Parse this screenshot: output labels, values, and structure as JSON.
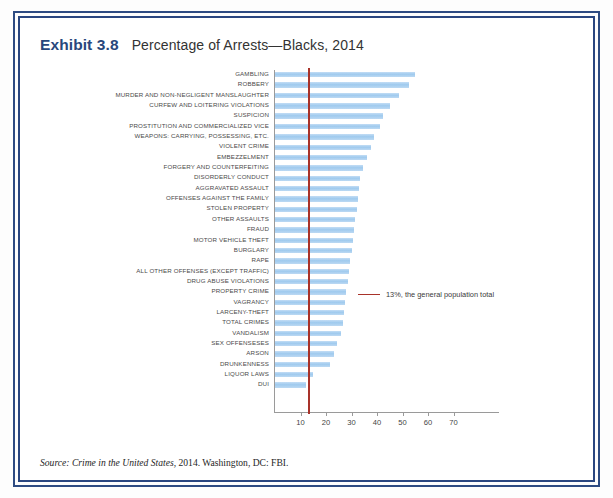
{
  "exhibit": {
    "number": "Exhibit 3.8",
    "title": "Percentage of Arrests—Blacks, 2014"
  },
  "source": {
    "prefix": "Source:",
    "work": "Crime in the United States",
    "rest": ", 2014. Washington, DC: FBI."
  },
  "legend": {
    "label": "13%, the general population total",
    "color": "#a8332a"
  },
  "colors": {
    "frame": "#2e4b82",
    "bar": "#a9d0f0",
    "reference": "#a8332a",
    "axis": "#9a9a9a",
    "heading": "#28477c"
  },
  "chart_data": {
    "type": "bar",
    "orientation": "horizontal",
    "title": "Percentage of Arrests—Blacks, 2014",
    "xlabel": "",
    "ylabel": "",
    "xlim": [
      0,
      72
    ],
    "xticks": [
      10,
      20,
      30,
      40,
      50,
      60,
      70
    ],
    "grid": false,
    "legend_position": "middle-right",
    "reference_line": {
      "value": 13,
      "label": "13%, the general population total",
      "color": "#a8332a"
    },
    "categories": [
      "GAMBLING",
      "ROBBERY",
      "MURDER AND NON-NEGLIGENT MANSLAUGHTER",
      "CURFEW AND LOITERING VIOLATIONS",
      "SUSPICION",
      "PROSTITUTION AND COMMERCIALIZED VICE",
      "WEAPONS: CARRYING, POSSESSING, ETC.",
      "VIOLENT CRIME",
      "EMBEZZELMENT",
      "FORGERY AND COUNTERFEITING",
      "DISORDERLY CONDUCT",
      "AGGRAVATED ASSAULT",
      "OFFENSES AGAINST THE FAMILY",
      "STOLEN PROPERTY",
      "OTHER ASSAULTS",
      "FRAUD",
      "MOTOR VEHICLE THEFT",
      "BURGLARY",
      "RAPE",
      "ALL OTHER OFFENSES (EXCEPT TRAFFIC)",
      "DRUG ABUSE VIOLATIONS",
      "PROPERTY CRIME",
      "VAGRANCY",
      "LARCENY-THEFT",
      "TOTAL CRIMES",
      "VANDALISM",
      "SEX OFFENSESES",
      "ARSON",
      "DRUNKENNESS",
      "LIQUOR LAWS",
      "DUI"
    ],
    "values": [
      55.0,
      52.5,
      48.5,
      45.0,
      42.5,
      41.0,
      39.0,
      37.5,
      36.0,
      34.5,
      33.5,
      33.0,
      32.5,
      32.0,
      31.5,
      31.0,
      30.5,
      30.0,
      29.5,
      29.0,
      28.5,
      28.0,
      27.5,
      27.0,
      26.5,
      26.0,
      24.5,
      23.0,
      21.5,
      15.0,
      12.0
    ],
    "units": "percent"
  }
}
